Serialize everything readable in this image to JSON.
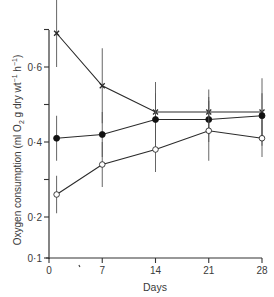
{
  "chart_data": {
    "type": "line",
    "title": "",
    "xlabel": "Days",
    "ylabel": "Oxygen consumption (ml O2 g dry wt-1 h-1)",
    "ylabel_parts": {
      "main": "Oxygen consumption (ml O",
      "sub": "2",
      "mid": " g dry wt",
      "sup1": "−1",
      "mid2": " h",
      "sup2": "−1",
      "end": ")"
    },
    "xlim": [
      0,
      28
    ],
    "ylim": [
      0.1,
      0.7
    ],
    "y_axis_break_below": 0.2,
    "x_ticks": [
      0,
      7,
      14,
      21,
      28
    ],
    "x_tick_labels": [
      "0",
      "7",
      "14",
      "21",
      "28"
    ],
    "y_ticks": [
      0.1,
      0.2,
      0.3,
      0.4,
      0.5,
      0.6,
      0.7
    ],
    "y_tick_labels": [
      "0·1",
      "0·2",
      "",
      "0·4",
      "",
      "0·6",
      ""
    ],
    "grid": false,
    "legend": null,
    "series": [
      {
        "name": "crosses",
        "marker": "x",
        "x": [
          1,
          7,
          14,
          21,
          28
        ],
        "values": [
          0.69,
          0.55,
          0.48,
          0.48,
          0.48
        ],
        "error": [
          0.09,
          0.1,
          0.08,
          0.06,
          0.09
        ]
      },
      {
        "name": "filled-circles",
        "marker": "filled-circle",
        "x": [
          1,
          7,
          14,
          21,
          28
        ],
        "values": [
          0.41,
          0.42,
          0.46,
          0.46,
          0.47
        ],
        "error": [
          0.06,
          0.06,
          0.07,
          0.06,
          0.06
        ]
      },
      {
        "name": "open-circles",
        "marker": "open-circle",
        "x": [
          1,
          7,
          14,
          21,
          28
        ],
        "values": [
          0.26,
          0.34,
          0.38,
          0.43,
          0.41
        ],
        "error": [
          0.05,
          0.06,
          0.06,
          0.08,
          0.05
        ]
      }
    ]
  },
  "colors": {
    "ink": "#2a2a2a",
    "axis": "#333333",
    "background": "#ffffff"
  }
}
